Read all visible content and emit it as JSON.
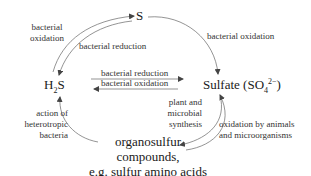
{
  "diagram": {
    "nodes": {
      "sulfur": {
        "label": "S"
      },
      "hydrogen_sulfide": {
        "prefix": "H",
        "sub": "2",
        "suffix": "S"
      },
      "sulfate": {
        "prefix": "Sulfate (SO",
        "sub": "4",
        "sup": "2−",
        "suffix": ")"
      },
      "organosulfur": {
        "line1": "organosulfur",
        "line2": "compounds,",
        "line3": "e.g. sulfur amino acids"
      }
    },
    "edges": {
      "h2s_to_s": {
        "line1": "bacterial",
        "line2": "oxidation"
      },
      "s_to_h2s": {
        "label": "bacterial reduction"
      },
      "s_to_sulfate": {
        "label": "bacterial oxidation"
      },
      "sulfate_to_h2s": {
        "label": "bacterial reduction"
      },
      "h2s_to_sulfate": {
        "label": "bacterial oxidation"
      },
      "sulfate_to_organo": {
        "line1": "plant and",
        "line2": "microbial",
        "line3": "synthesis"
      },
      "organo_to_sulfate": {
        "line1": "oxidation by animals",
        "line2": "and microorganisms"
      },
      "organo_to_h2s": {
        "line1": "action of",
        "line2": "heterotropic",
        "line3": "bacteria"
      }
    },
    "colors": {
      "arrow": "#555555",
      "text": "#222222",
      "background": "#ffffff"
    }
  }
}
